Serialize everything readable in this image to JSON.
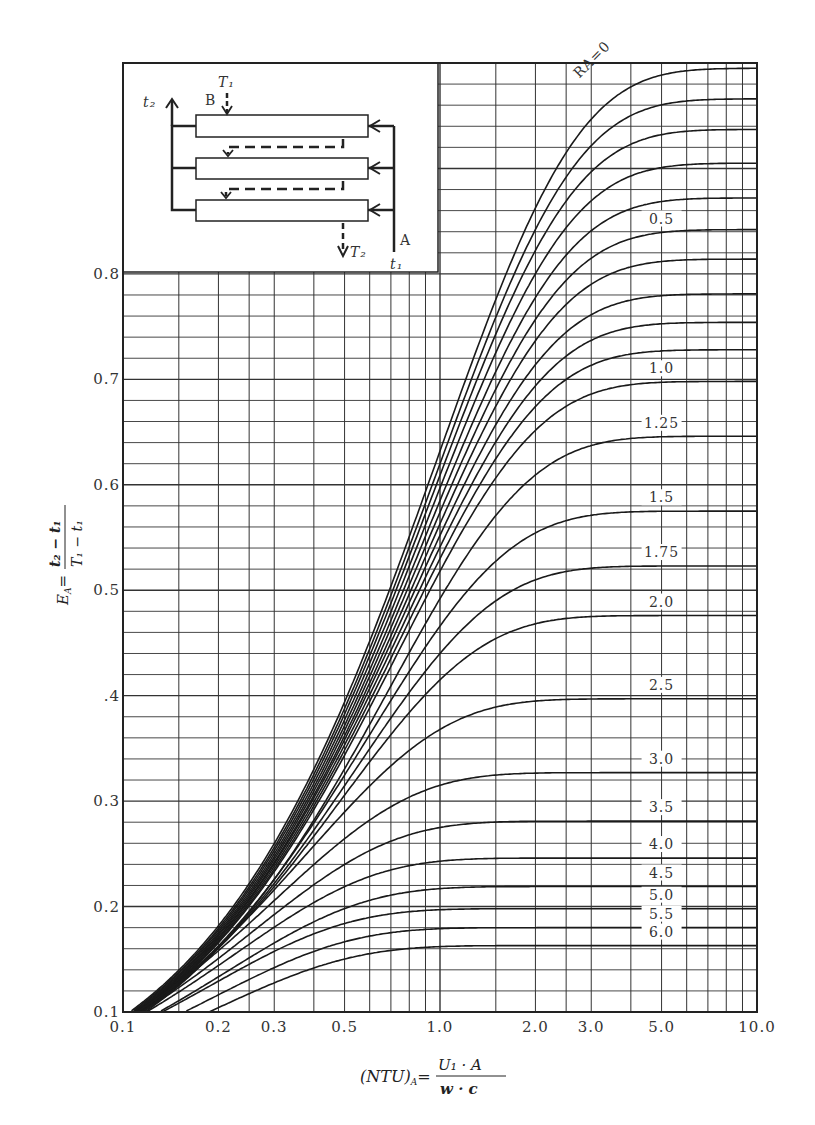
{
  "chart_data": {
    "type": "line",
    "title": "",
    "xlabel": "(NTU)_A = U1·A / (w·c)",
    "ylabel": "E_A = (t2 − t1) / (T1 − t1)",
    "xscale": "log",
    "xlim": [
      0.1,
      10.0
    ],
    "ylim": [
      0.1,
      1.0
    ],
    "grid": true,
    "x_tick_labels": [
      "0.1",
      "0.2",
      "0.3",
      "0.5",
      "1.0",
      "2.0",
      "3.0",
      "5.0",
      "10.0"
    ],
    "x_ticks": [
      0.1,
      0.2,
      0.3,
      0.5,
      1.0,
      2.0,
      3.0,
      5.0,
      10.0
    ],
    "y_tick_labels": [
      "0.1",
      "0.2",
      "0.3",
      ".4",
      "0.5",
      "0.6",
      "0.7",
      "0.8"
    ],
    "y_ticks": [
      0.1,
      0.2,
      0.3,
      0.4,
      0.5,
      0.6,
      0.7,
      0.8
    ],
    "x_gridlines": [
      0.1,
      0.15,
      0.2,
      0.25,
      0.3,
      0.4,
      0.5,
      0.6,
      0.7,
      0.8,
      0.9,
      1.0,
      1.5,
      2.0,
      2.5,
      3.0,
      4.0,
      5.0,
      6.0,
      7.0,
      8.0,
      9.0,
      10.0
    ],
    "y_grid_step": 0.02,
    "legend_title": "R_A",
    "series": [
      {
        "name": "R_A=0",
        "label": "RA=0",
        "asymptote": 0.995,
        "e_at_ntu1": 0.632
      },
      {
        "name": "0.1",
        "label": "",
        "asymptote": 0.966,
        "e_at_ntu1": 0.62
      },
      {
        "name": "0.2",
        "label": "",
        "asymptote": 0.937,
        "e_at_ntu1": 0.609
      },
      {
        "name": "0.3",
        "label": "",
        "asymptote": 0.905,
        "e_at_ntu1": 0.597
      },
      {
        "name": "0.4",
        "label": "",
        "asymptote": 0.872,
        "e_at_ntu1": 0.585
      },
      {
        "name": "0.5",
        "label": "0.5",
        "asymptote": 0.842,
        "e_at_ntu1": 0.574
      },
      {
        "name": "0.6",
        "label": "",
        "asymptote": 0.814,
        "e_at_ntu1": 0.563
      },
      {
        "name": "0.7",
        "label": "",
        "asymptote": 0.781,
        "e_at_ntu1": 0.552
      },
      {
        "name": "0.8",
        "label": "",
        "asymptote": 0.754,
        "e_at_ntu1": 0.541
      },
      {
        "name": "0.9",
        "label": "",
        "asymptote": 0.728,
        "e_at_ntu1": 0.53
      },
      {
        "name": "1.0",
        "label": "1.0",
        "asymptote": 0.698,
        "e_at_ntu1": 0.518
      },
      {
        "name": "1.25",
        "label": "1.25",
        "asymptote": 0.646,
        "e_at_ntu1": 0.492
      },
      {
        "name": "1.5",
        "label": "1.5",
        "asymptote": 0.575,
        "e_at_ntu1": 0.466
      },
      {
        "name": "1.75",
        "label": "1.75",
        "asymptote": 0.523,
        "e_at_ntu1": 0.44
      },
      {
        "name": "2.0",
        "label": "2.0",
        "asymptote": 0.476,
        "e_at_ntu1": 0.415
      },
      {
        "name": "2.5",
        "label": "2.5",
        "asymptote": 0.397,
        "e_at_ntu1": 0.368
      },
      {
        "name": "3.0",
        "label": "3.0",
        "asymptote": 0.327,
        "e_at_ntu1": 0.315
      },
      {
        "name": "3.5",
        "label": "3.5",
        "asymptote": 0.281,
        "e_at_ntu1": 0.275
      },
      {
        "name": "4.0",
        "label": "4.0",
        "asymptote": 0.246,
        "e_at_ntu1": 0.243
      },
      {
        "name": "4.5",
        "label": "4.5",
        "asymptote": 0.219,
        "e_at_ntu1": 0.217
      },
      {
        "name": "5.0",
        "label": "5.0",
        "asymptote": 0.198,
        "e_at_ntu1": 0.197
      },
      {
        "name": "5.5",
        "label": "5.5",
        "asymptote": 0.18,
        "e_at_ntu1": 0.179
      },
      {
        "name": "6.0",
        "label": "6.0",
        "asymptote": 0.163,
        "e_at_ntu1": 0.162
      }
    ],
    "annotations": [
      "RA=0",
      "0.5",
      "1.0",
      "1.25",
      "1.5",
      "1.75",
      "2.0",
      "2.5",
      "3.0",
      "3.5",
      "4.0",
      "4.5",
      "5.0",
      "5.5",
      "6.0"
    ]
  },
  "inset": {
    "labels": {
      "t2": "t₂",
      "T1": "T₁",
      "B": "B",
      "A": "A",
      "T2": "T₂",
      "t1": "t₁"
    }
  },
  "axes": {
    "x_title_prefix": "(NTU)",
    "x_title_sub": "A",
    "x_title_num": "U₁ · A",
    "x_title_den": "w · c",
    "y_title_prefix": "E",
    "y_title_sub": "A",
    "y_title_num": "t₂ − t₁",
    "y_title_den": "T₁ − t₁"
  }
}
